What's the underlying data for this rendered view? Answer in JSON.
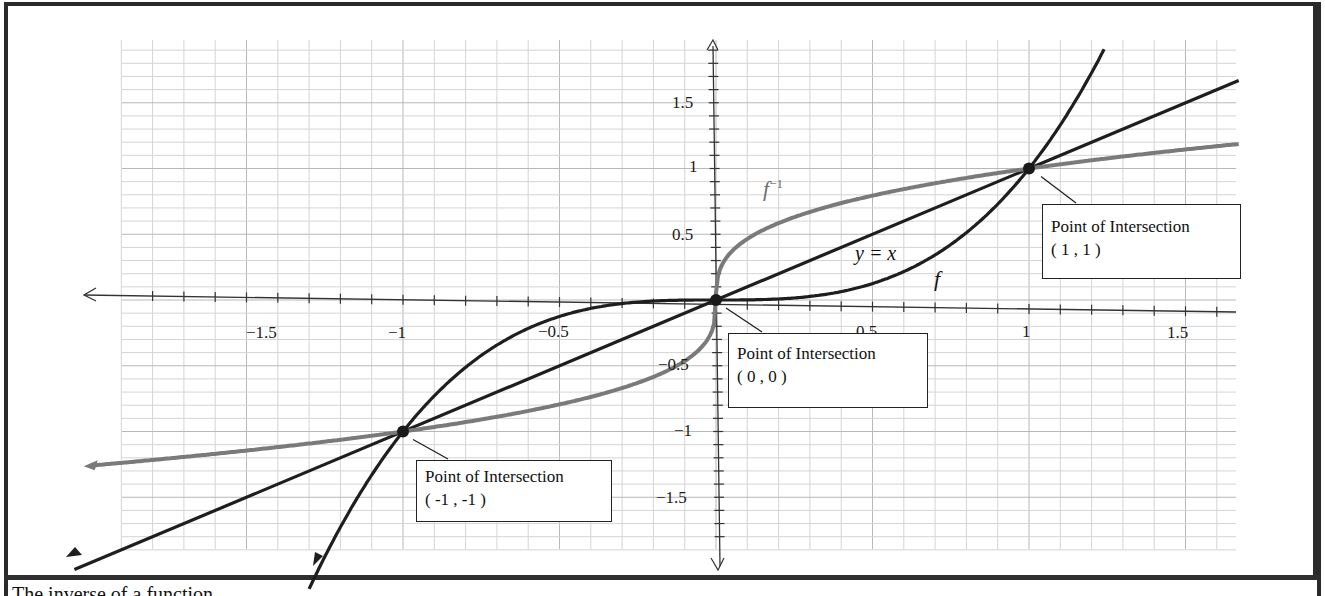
{
  "chart_data": {
    "type": "line",
    "title": "",
    "xlabel": "",
    "ylabel": "",
    "xlim": [
      -1.9,
      1.8
    ],
    "ylim": [
      -1.9,
      1.9
    ],
    "grid": true,
    "x_ticks": [
      -1.5,
      -1,
      -0.5,
      0.5,
      1,
      1.5
    ],
    "x_tick_labels": [
      "−1.5",
      "−1",
      "−0.5",
      "0.5",
      "1",
      "1.5"
    ],
    "y_ticks": [
      1.5,
      1,
      0.5,
      -0.5,
      -1,
      -1.5
    ],
    "y_tick_labels": [
      "1.5",
      "1",
      "0.5",
      "−0.5",
      "−1",
      "−1.5"
    ],
    "series": [
      {
        "name": "f",
        "expression": "y = x^3",
        "color": "#1e1e1e",
        "x": [
          -1.3,
          -1,
          -0.5,
          0,
          0.5,
          1,
          1.24
        ],
        "values": [
          -2.2,
          -1,
          -0.125,
          0,
          0.125,
          1,
          1.9
        ]
      },
      {
        "name": "f⁻¹",
        "expression": "y = x^(1/3)",
        "color": "#7a7a7a",
        "x": [
          -1.9,
          -1,
          -0.5,
          0,
          0.5,
          1,
          1.8
        ],
        "values": [
          -1.24,
          -1,
          -0.79,
          0,
          0.79,
          1,
          1.22
        ]
      },
      {
        "name": "y = x",
        "expression": "y = x",
        "color": "#1e1e1e",
        "x": [
          -1.9,
          -1,
          0,
          1,
          1.8
        ],
        "values": [
          -1.9,
          -1,
          0,
          1,
          1.8
        ]
      }
    ],
    "annotations": [
      {
        "text": "Point of Intersection",
        "coords": "( -1 , -1 )",
        "x": -1,
        "y": -1
      },
      {
        "text": "Point of Intersection",
        "coords": "( 0 , 0 )",
        "x": 0,
        "y": 0
      },
      {
        "text": "Point of Intersection",
        "coords": "( 1 , 1 )",
        "x": 1,
        "y": 1
      }
    ],
    "curve_labels": [
      {
        "text": "f",
        "sup": "−1"
      },
      {
        "text": "y = x"
      },
      {
        "text": "f"
      }
    ]
  },
  "labels": {
    "finv_base": "f",
    "finv_sup": "−1",
    "identity": "y = x",
    "f": "f"
  },
  "callouts": [
    {
      "title": "Point of Intersection",
      "coords": "( -1 , -1 )"
    },
    {
      "title": "Point of Intersection",
      "coords": "( 0 , 0 )"
    },
    {
      "title": "Point of Intersection",
      "coords": "( 1 , 1 )"
    }
  ],
  "ticks": {
    "x": [
      "−1.5",
      "−1",
      "−0.5",
      "0.5",
      "1",
      "1.5"
    ],
    "y": [
      "1.5",
      "1",
      "0.5",
      "−0.5",
      "−1",
      "−1.5"
    ]
  },
  "caption": "The inverse of a function"
}
